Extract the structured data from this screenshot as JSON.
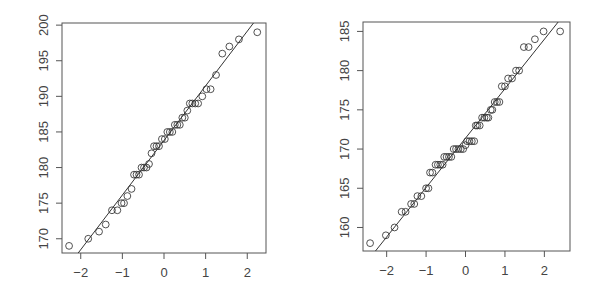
{
  "chart_data": [
    {
      "type": "scatter",
      "subtype": "normal-qq-plot",
      "title": "",
      "xlabel": "",
      "ylabel": "",
      "xlim": [
        -2.45,
        2.45
      ],
      "ylim": [
        168,
        200.3
      ],
      "x_ticks": [
        -2,
        -1,
        0,
        1,
        2
      ],
      "y_ticks": [
        170,
        175,
        180,
        185,
        190,
        195,
        200
      ],
      "grid": false,
      "legend": null,
      "reference_line": {
        "x1": -2.1,
        "y1": 167.7,
        "x2": 2.15,
        "y2": 200.3
      },
      "points": [
        [
          -2.28,
          169
        ],
        [
          -1.82,
          170
        ],
        [
          -1.56,
          171
        ],
        [
          -1.4,
          172
        ],
        [
          -1.25,
          174
        ],
        [
          -1.12,
          174
        ],
        [
          -1.02,
          175
        ],
        [
          -0.96,
          175
        ],
        [
          -0.88,
          176
        ],
        [
          -0.78,
          177
        ],
        [
          -0.72,
          179
        ],
        [
          -0.66,
          179
        ],
        [
          -0.6,
          179
        ],
        [
          -0.54,
          180
        ],
        [
          -0.48,
          180
        ],
        [
          -0.42,
          180
        ],
        [
          -0.36,
          180.5
        ],
        [
          -0.3,
          182
        ],
        [
          -0.24,
          183
        ],
        [
          -0.18,
          183
        ],
        [
          -0.12,
          183
        ],
        [
          -0.05,
          184
        ],
        [
          0.02,
          184
        ],
        [
          0.08,
          185
        ],
        [
          0.14,
          185
        ],
        [
          0.2,
          185
        ],
        [
          0.26,
          186
        ],
        [
          0.32,
          186
        ],
        [
          0.38,
          186
        ],
        [
          0.44,
          187
        ],
        [
          0.5,
          187
        ],
        [
          0.56,
          188
        ],
        [
          0.62,
          189
        ],
        [
          0.68,
          189
        ],
        [
          0.75,
          189
        ],
        [
          0.82,
          189
        ],
        [
          0.92,
          190
        ],
        [
          1.02,
          191
        ],
        [
          1.12,
          191
        ],
        [
          1.25,
          193
        ],
        [
          1.4,
          196
        ],
        [
          1.57,
          197
        ],
        [
          1.8,
          198
        ],
        [
          2.24,
          199
        ]
      ]
    },
    {
      "type": "scatter",
      "subtype": "normal-qq-plot",
      "title": "",
      "xlabel": "",
      "ylabel": "",
      "xlim": [
        -2.6,
        2.65
      ],
      "ylim": [
        157,
        186.2
      ],
      "x_ticks": [
        -2,
        -1,
        0,
        1,
        2
      ],
      "y_ticks": [
        160,
        165,
        170,
        175,
        180,
        185
      ],
      "grid": false,
      "legend": null,
      "reference_line": {
        "x1": -2.3,
        "y1": 156.9,
        "x2": 2.35,
        "y2": 186.2
      },
      "points": [
        [
          -2.42,
          158
        ],
        [
          -2.02,
          159
        ],
        [
          -1.8,
          160
        ],
        [
          -1.62,
          162
        ],
        [
          -1.52,
          162
        ],
        [
          -1.38,
          163
        ],
        [
          -1.3,
          163
        ],
        [
          -1.22,
          164
        ],
        [
          -1.12,
          164
        ],
        [
          -1.0,
          165
        ],
        [
          -0.94,
          165
        ],
        [
          -0.9,
          167
        ],
        [
          -0.84,
          167
        ],
        [
          -0.76,
          168
        ],
        [
          -0.7,
          168
        ],
        [
          -0.64,
          168
        ],
        [
          -0.58,
          168
        ],
        [
          -0.54,
          169
        ],
        [
          -0.48,
          169
        ],
        [
          -0.42,
          169
        ],
        [
          -0.36,
          169
        ],
        [
          -0.3,
          170
        ],
        [
          -0.24,
          170
        ],
        [
          -0.18,
          170
        ],
        [
          -0.12,
          170
        ],
        [
          -0.06,
          170
        ],
        [
          0.0,
          170.5
        ],
        [
          0.04,
          171
        ],
        [
          0.1,
          171
        ],
        [
          0.16,
          171
        ],
        [
          0.22,
          171
        ],
        [
          0.26,
          173
        ],
        [
          0.3,
          173
        ],
        [
          0.36,
          173
        ],
        [
          0.42,
          174
        ],
        [
          0.48,
          174
        ],
        [
          0.54,
          174
        ],
        [
          0.58,
          174
        ],
        [
          0.64,
          175
        ],
        [
          0.68,
          175
        ],
        [
          0.74,
          176
        ],
        [
          0.8,
          176
        ],
        [
          0.86,
          176
        ],
        [
          0.92,
          178
        ],
        [
          1.0,
          178
        ],
        [
          1.08,
          179
        ],
        [
          1.18,
          179
        ],
        [
          1.28,
          180
        ],
        [
          1.36,
          180
        ],
        [
          1.48,
          183
        ],
        [
          1.6,
          183
        ],
        [
          1.76,
          184
        ],
        [
          1.98,
          185
        ],
        [
          2.4,
          185
        ]
      ]
    }
  ],
  "plots": [
    {
      "frame": {
        "left": 62,
        "top": 23,
        "right": 266,
        "bottom": 253
      },
      "x_tick_labels": [
        "−2",
        "−1",
        "0",
        "1",
        "2"
      ],
      "y_tick_labels": [
        "170",
        "175",
        "180",
        "185",
        "190",
        "195",
        "200"
      ]
    },
    {
      "frame": {
        "left": 363,
        "top": 22,
        "right": 570,
        "bottom": 251
      },
      "x_tick_labels": [
        "−2",
        "−1",
        "0",
        "1",
        "2"
      ],
      "y_tick_labels": [
        "160",
        "165",
        "170",
        "175",
        "180",
        "185"
      ]
    }
  ]
}
